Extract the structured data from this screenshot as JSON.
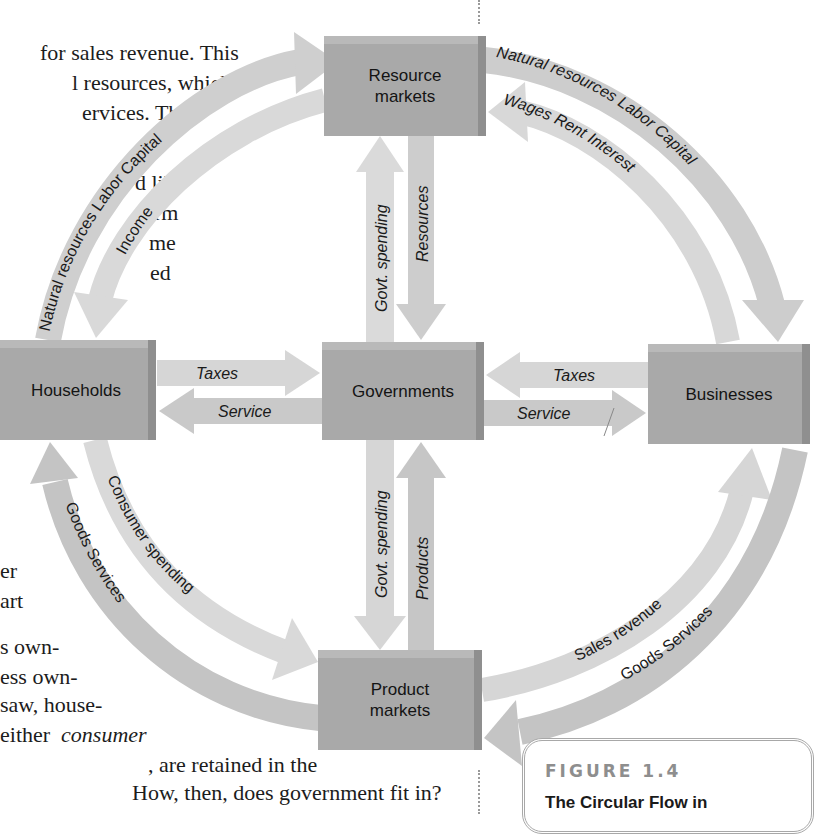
{
  "body_text": {
    "lines_top": [
      "for sales revenue. This",
      "l resources, which",
      "ervices. Thus"
    ],
    "lines_mid": [
      "d like",
      "orm",
      "me",
      "ed"
    ],
    "lines_lower": [
      "er",
      "art"
    ],
    "lines_bottom": [
      "s own-",
      "ess own-",
      " saw, house-",
      "either",
      ", are retained in the",
      "How, then, does government fit in?"
    ],
    "italic_word": "consumer"
  },
  "diagram": {
    "boxes": {
      "resource_markets": "Resource\nmarkets",
      "households": "Households",
      "governments": "Governments",
      "businesses": "Businesses",
      "product_markets": "Product\nmarkets"
    },
    "flows": {
      "hh_to_resource_outer": "Natural resources   Labor   Capital",
      "resource_to_hh_inner": "Income",
      "resource_to_biz_outer": "Natural resources   Labor   Capital",
      "biz_to_resource_inner": "Wages   Rent   Interest",
      "gov_to_resource": "Govt. spending",
      "resource_to_gov": "Resources",
      "hh_to_gov_taxes": "Taxes",
      "gov_to_hh_service": "Service",
      "biz_to_gov_taxes": "Taxes",
      "gov_to_biz_service": "Service",
      "gov_to_product": "Govt. spending",
      "product_to_gov": "Products",
      "hh_to_product_inner": "Consumer spending",
      "product_to_hh_outer": "Goods   Services",
      "product_to_biz_inner": "Sales revenue",
      "biz_to_product_outer": "Goods   Services"
    },
    "colors": {
      "box_fill": "#a9a9a9",
      "arrow_light": "#d6d6d6",
      "arrow_mid": "#c6c6c6"
    }
  },
  "figure_caption": {
    "label": "FIGURE 1.4",
    "title": "The Circular Flow in"
  }
}
